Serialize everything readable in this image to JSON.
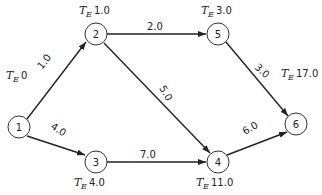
{
  "diagram": {
    "type": "network-activity-on-arrow",
    "nodes": [
      {
        "id": "1",
        "label": "1",
        "te_prefix": "T",
        "te_sub": "E",
        "te_value": "0"
      },
      {
        "id": "2",
        "label": "2",
        "te_prefix": "T",
        "te_sub": "E",
        "te_value": "1.0"
      },
      {
        "id": "3",
        "label": "3",
        "te_prefix": "T",
        "te_sub": "E",
        "te_value": "4.0"
      },
      {
        "id": "4",
        "label": "4",
        "te_prefix": "T",
        "te_sub": "E",
        "te_value": "11.0"
      },
      {
        "id": "5",
        "label": "5",
        "te_prefix": "T",
        "te_sub": "E",
        "te_value": "3.0"
      },
      {
        "id": "6",
        "label": "6",
        "te_prefix": "T",
        "te_sub": "E",
        "te_value": "17.0"
      }
    ],
    "edges": [
      {
        "from": "1",
        "to": "2",
        "label": "1.0"
      },
      {
        "from": "1",
        "to": "3",
        "label": "4.0"
      },
      {
        "from": "2",
        "to": "5",
        "label": "2.0"
      },
      {
        "from": "2",
        "to": "4",
        "label": "5.0"
      },
      {
        "from": "3",
        "to": "4",
        "label": "7.0"
      },
      {
        "from": "5",
        "to": "6",
        "label": "3.0"
      },
      {
        "from": "4",
        "to": "6",
        "label": "6.0"
      }
    ]
  }
}
